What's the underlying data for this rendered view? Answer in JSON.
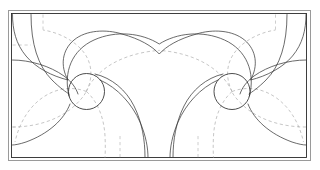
{
  "figure": {
    "background_color": "#ffffff",
    "width": 320,
    "height": 170
  },
  "frame": {
    "name": "bounding-rectangle",
    "outer": {
      "x": 8.5,
      "y": 10.5,
      "width": 302,
      "height": 150
    },
    "inner": {
      "x": 11.5,
      "y": 13.5,
      "width": 295,
      "height": 144
    },
    "outer_color": "#9a9a9a",
    "inner_color": "#2b2b2b"
  },
  "vortices": [
    {
      "name": "left-vortex-core",
      "cx": 86.5,
      "cy": 91.5,
      "r": 18.0,
      "sense": "counter-clockwise"
    },
    {
      "name": "right-vortex-core",
      "cx": 232.0,
      "cy": 91.5,
      "r": 18.0,
      "sense": "clockwise"
    }
  ],
  "line_styles": {
    "streamline": {
      "label": "streamline",
      "color": "#3a3a3a",
      "style": "solid",
      "width": 0.75
    },
    "equipotential": {
      "label": "equipotential",
      "color": "#b3b3b3",
      "style": "dashed",
      "width": 0.75
    },
    "axis": {
      "label": "reference axis",
      "color": "#bdbdbd",
      "style": "dashed",
      "width": 0.75
    }
  },
  "reference_lines": {
    "vertical_dashed_x": [
      43.0,
      275.0
    ],
    "vertical_dashed_lower_x": [
      120.0,
      198.0
    ],
    "horizontal_dashed_y": [
      45.0,
      127.0
    ],
    "symmetry_axis_x": 159.25
  },
  "chart_data": {
    "type": "line",
    "xlabel": "",
    "ylabel": "",
    "xlim": [
      11.5,
      306.5
    ],
    "ylim": [
      13.5,
      157.5
    ],
    "grid": false,
    "legend": "none",
    "series": [
      {
        "name": "outer-cap-streamline",
        "style": "solid",
        "path": "M 12.5,14.5 C 12.5,30 16,44 26,56 C 36,68 52,76 68,80 C 60,66 62,50 74,40 C 86,30 106,29 122,34 C 140,39 152,46 159.25,54 C 166.5,46 178.5,39 196.5,34 C 212.5,29 232.5,30 244.5,40 C 256.5,50 258.5,66 250.5,80 C 266.5,76 282.5,68 292.5,56 C 302.5,44 306,30 306,14.5"
      },
      {
        "name": "top-arch-streamline",
        "style": "solid",
        "path": "M 69,96 C 63,72 72,50 94,40 C 116,30 142,33 159.25,44 C 176.5,33 202.5,30 224.5,40 C 246.5,50 255.5,72 249.5,96"
      },
      {
        "name": "left-spiral-arm-upper",
        "style": "solid",
        "path": "M 12.5,60 C 30,60 50,66 64,76 C 72,82 76,88 78,94"
      },
      {
        "name": "left-spiral-arm-lower",
        "style": "solid",
        "path": "M 70,104 C 64,120 48,134 26,142 C 20,144 15,145 12.5,145"
      },
      {
        "name": "left-inner-spiral",
        "style": "solid",
        "path": "M 95,74 C 112,78 126,90 134,106 C 142,122 145,140 145,157"
      },
      {
        "name": "left-outer-spiral",
        "style": "solid",
        "path": "M 100,80 C 118,88 132,104 140,122 C 146,136 148,148 148,157.5"
      },
      {
        "name": "right-spiral-arm-upper",
        "style": "solid",
        "path": "M 306,60 C 288,60 268,66 254,76 C 246,82 242,88 240,94"
      },
      {
        "name": "right-spiral-arm-lower",
        "style": "solid",
        "path": "M 248,104 C 254,120 270,134 292,142 C 298,144 303,145 306,145"
      },
      {
        "name": "right-inner-spiral",
        "style": "solid",
        "path": "M 223,74 C 206,78 192,90 184,106 C 176,122 173,140 173,157"
      },
      {
        "name": "right-outer-spiral",
        "style": "solid",
        "path": "M 218,80 C 200,88 186,104 178,122 C 172,136 170,148 170,157.5"
      },
      {
        "name": "left-edge-descending-streamline",
        "style": "solid",
        "path": "M 31,14.5 C 31,44 38,66 52,80 C 60,88 66,92 69,94"
      },
      {
        "name": "right-edge-descending-streamline",
        "style": "solid",
        "path": "M 287,14.5 C 287,44 280,66 266,80 C 258,88 252,92 249,94"
      },
      {
        "name": "left-equipotential-outer",
        "style": "dashed",
        "path": "M 12.5,127 C 34,127 56,121 72,108 C 80,101 84,96 86,92"
      },
      {
        "name": "right-equipotential-outer",
        "style": "dashed",
        "path": "M 306,127 C 284,127 262,121 246,108 C 238,101 234,96 232,92"
      },
      {
        "name": "left-equipotential-upper-arc",
        "style": "dashed",
        "path": "M 86,91.5 C 96,70 118,57 146,52 C 150.5,51.2 155,50.7 159.25,50.4"
      },
      {
        "name": "right-equipotential-upper-arc",
        "style": "dashed",
        "path": "M 232,91.5 C 222,70 200,57 172.5,52 C 168,51.2 163.5,50.7 159.25,50.4"
      },
      {
        "name": "left-equipotential-spiral-a",
        "style": "dashed",
        "path": "M 86.5,91.5 C 72,86 56,88 42,98 C 28,108 19,124 15,142"
      },
      {
        "name": "right-equipotential-spiral-a",
        "style": "dashed",
        "path": "M 232,91.5 C 246.5,86 262.5,88 276.5,98 C 290.5,108 299.5,124 303.5,142"
      },
      {
        "name": "left-equipotential-spiral-b",
        "style": "dashed",
        "path": "M 86.5,91.5 C 98,102 104,118 105,136 C 105.4,144 105.4,151 105,157.5"
      },
      {
        "name": "right-equipotential-spiral-b",
        "style": "dashed",
        "path": "M 232,91.5 C 220.5,102 214.5,118 213.5,136 C 213.1,144 213.1,151 213.5,157.5"
      },
      {
        "name": "left-equipotential-spiral-c",
        "style": "dashed",
        "path": "M 86.5,91.5 C 94,76 92,60 80,48 C 70,38 56,32 43,30"
      },
      {
        "name": "right-equipotential-spiral-c",
        "style": "dashed",
        "path": "M 232,91.5 C 224.5,76 226.5,60 238.5,48 C 248.5,38 262.5,32 275.5,30"
      },
      {
        "name": "left-vertical-reference",
        "style": "dashed",
        "path": "M 43,14.5 L 43,30"
      },
      {
        "name": "right-vertical-reference",
        "style": "dashed",
        "path": "M 275.5,14.5 L 275.5,30"
      },
      {
        "name": "left-lower-vertical-reference",
        "style": "dashed",
        "path": "M 120,136 L 120,157.5"
      },
      {
        "name": "right-lower-vertical-reference",
        "style": "dashed",
        "path": "M 198,136 L 198,157.5"
      },
      {
        "name": "top-horizontal-reference",
        "style": "dashed",
        "path": "M 12.5,45 L 31,45"
      },
      {
        "name": "bottom-left-horizontal-reference",
        "style": "dashed",
        "path": "M 12.5,127 L 20,127"
      }
    ]
  }
}
